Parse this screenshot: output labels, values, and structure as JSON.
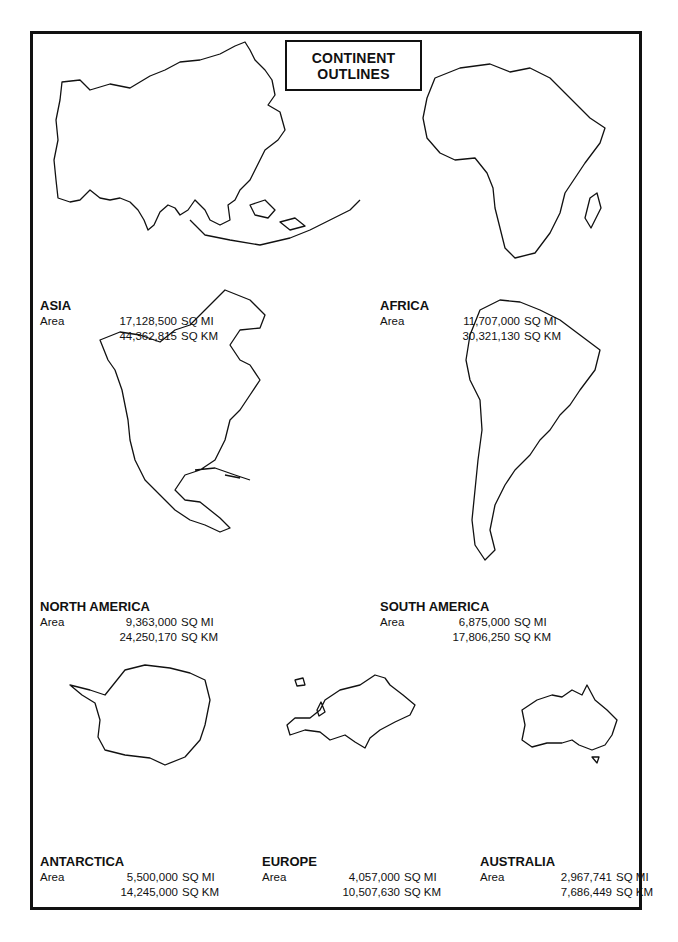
{
  "title": {
    "line1": "CONTINENT",
    "line2": "OUTLINES"
  },
  "area_label": "Area",
  "continents": [
    {
      "name": "ASIA",
      "sq_mi": "17,128,500",
      "sq_km": "44,362,815",
      "unit_mi": "SQ MI",
      "unit_km": "SQ KM"
    },
    {
      "name": "AFRICA",
      "sq_mi": "11,707,000",
      "sq_km": "30,321,130",
      "unit_mi": "SQ MI",
      "unit_km": "SQ KM"
    },
    {
      "name": "NORTH AMERICA",
      "sq_mi": "9,363,000",
      "sq_km": "24,250,170",
      "unit_mi": "SQ MI",
      "unit_km": "SQ KM"
    },
    {
      "name": "SOUTH AMERICA",
      "sq_mi": "6,875,000",
      "sq_km": "17,806,250",
      "unit_mi": "SQ MI",
      "unit_km": "SQ KM"
    },
    {
      "name": "ANTARCTICA",
      "sq_mi": "5,500,000",
      "sq_km": "14,245,000",
      "unit_mi": "SQ MI",
      "unit_km": "SQ KM"
    },
    {
      "name": "EUROPE",
      "sq_mi": "4,057,000",
      "sq_km": "10,507,630",
      "unit_mi": "SQ MI",
      "unit_km": "SQ KM"
    },
    {
      "name": "AUSTRALIA",
      "sq_mi": "2,967,741",
      "sq_km": "7,686,449",
      "unit_mi": "SQ MI",
      "unit_km": "SQ KM"
    }
  ]
}
